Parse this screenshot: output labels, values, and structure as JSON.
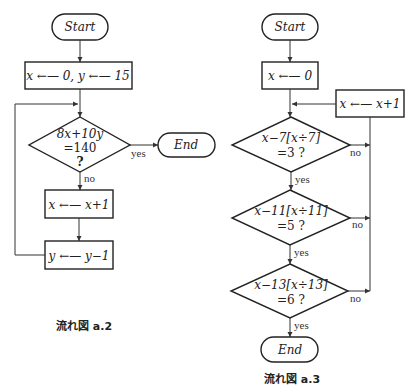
{
  "left_chart": {
    "caption": "流れ図 a.2",
    "start": "Start",
    "init": "x ←— 0,  y ←— 15",
    "decision_line1": "8x+10y",
    "decision_line2": "=140",
    "decision_line3": "?",
    "yes_label": "yes",
    "no_label": "no",
    "end": "End",
    "step1": "x ←— x+1",
    "step2": "y ←— y−1"
  },
  "right_chart": {
    "caption": "流れ図 a.3",
    "start": "Start",
    "init": "x ←— 0",
    "increment": "x ←— x+1",
    "decision1_line1": "x−7[x÷7]",
    "decision1_line2": "=3 ?",
    "decision2_line1": "x−11[x÷11]",
    "decision2_line2": "=5 ?",
    "decision3_line1": "x−13[x÷13]",
    "decision3_line2": "=6 ?",
    "yes_label": "yes",
    "no_label": "no",
    "end": "End"
  }
}
